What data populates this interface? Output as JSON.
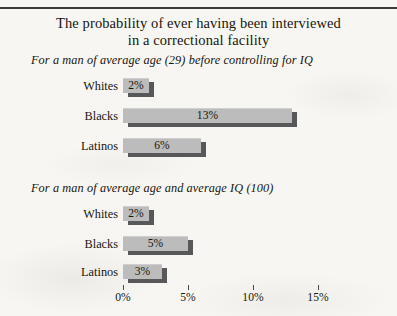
{
  "chart_data": {
    "type": "bar",
    "title": "The probability of ever having been interviewed in a correctional facility",
    "title_lines": [
      "The probability of ever having been interviewed",
      "in a correctional facility"
    ],
    "orientation": "horizontal",
    "xlabel": "",
    "ylabel": "",
    "xlim": [
      0,
      17.5
    ],
    "grid": false,
    "legend": false,
    "axis": {
      "tick_values": [
        0,
        5,
        10,
        15
      ],
      "tick_labels": [
        "0%",
        "5%",
        "10%",
        "15%"
      ]
    },
    "panels": [
      {
        "subtitle": "For a man of average age (29) before controlling for IQ",
        "categories": [
          "Whites",
          "Blacks",
          "Latinos"
        ],
        "values": [
          2,
          13,
          6
        ],
        "value_labels": [
          "2%",
          "13%",
          "6%"
        ]
      },
      {
        "subtitle": "For a man of average age and average IQ (100)",
        "categories": [
          "Whites",
          "Blacks",
          "Latinos"
        ],
        "values": [
          2,
          5,
          3
        ],
        "value_labels": [
          "2%",
          "5%",
          "3%"
        ]
      }
    ],
    "colors": {
      "bar_face": "#bcbcbc",
      "bar_shadow": "#58585a",
      "text": "#17160f",
      "background": "#f7f6f2",
      "rule": "#3c3a38"
    }
  }
}
